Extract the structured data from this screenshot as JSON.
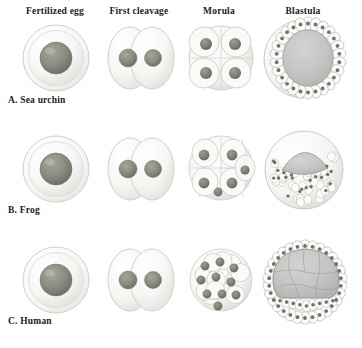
{
  "figure": {
    "background_color": "#ffffff",
    "palette": {
      "nucleus": "#878a7e",
      "nucleus_dark": "#6f7268",
      "membrane": "#f2f2f0",
      "membrane_stroke": "#c9c9c4",
      "cavity": "#c5c7c5",
      "cavity_stroke": "#9a9c99",
      "text": "#1c1c1c"
    }
  },
  "columns": [
    {
      "key": "fertilized_egg",
      "label": "Fertilized egg",
      "center_x": 55
    },
    {
      "key": "first_cleavage",
      "label": "First cleavage",
      "center_x": 139
    },
    {
      "key": "morula",
      "label": "Morula",
      "center_x": 219
    },
    {
      "key": "blastula",
      "label": "Blastula",
      "center_x": 303
    }
  ],
  "rows": [
    {
      "key": "sea_urchin",
      "label": "A. Sea urchin",
      "label_x": 8,
      "label_y": 101,
      "morula_nuclei": 4,
      "blastula_type": "central-cavity-ring"
    },
    {
      "key": "frog",
      "label": "B. Frog",
      "label_x": 8,
      "label_y": 211,
      "morula_nuclei": 6,
      "blastula_type": "offset-crescent-cavity"
    },
    {
      "key": "human",
      "label": "C. Human",
      "label_x": 8,
      "label_y": 322,
      "morula_nuclei": 10,
      "blastula_type": "inner-cell-mass"
    }
  ],
  "stages": [
    {
      "row": "sea_urchin",
      "column": "fertilized_egg",
      "name": "sea-urchin-fertilized-egg",
      "description": "Single round cell with outer membrane and one central nucleus",
      "cell_count": 1,
      "nuclei": 1
    },
    {
      "row": "sea_urchin",
      "column": "first_cleavage",
      "name": "sea-urchin-first-cleavage",
      "description": "Two overlapping oval cells each containing one nucleus",
      "cell_count": 2,
      "nuclei": 2
    },
    {
      "row": "sea_urchin",
      "column": "morula",
      "name": "sea-urchin-morula",
      "description": "Cluster of cells in two-by-two arrangement with four visible nuclei",
      "cell_count": 8,
      "nuclei": 4
    },
    {
      "row": "sea_urchin",
      "column": "blastula",
      "name": "sea-urchin-blastula",
      "description": "Hollow sphere with single layer of cells around a large central blastocoel",
      "cell_count": 32,
      "nuclei": 26
    },
    {
      "row": "frog",
      "column": "fertilized_egg",
      "name": "frog-fertilized-egg",
      "description": "Single round cell with outer membrane and one central nucleus",
      "cell_count": 1,
      "nuclei": 1
    },
    {
      "row": "frog",
      "column": "first_cleavage",
      "name": "frog-first-cleavage",
      "description": "Two overlapping oval cells each containing one nucleus",
      "cell_count": 2,
      "nuclei": 2
    },
    {
      "row": "frog",
      "column": "morula",
      "name": "frog-morula",
      "description": "Rounded cluster of cells with six visible nuclei",
      "cell_count": 12,
      "nuclei": 6
    },
    {
      "row": "frog",
      "column": "blastula",
      "name": "frog-blastula",
      "description": "Sphere of many small cells with an off-center crescent cavity near the top",
      "cell_count": 60,
      "nuclei": 34
    },
    {
      "row": "human",
      "column": "fertilized_egg",
      "name": "human-fertilized-egg",
      "description": "Single round cell with outer membrane and one central nucleus",
      "cell_count": 1,
      "nuclei": 1
    },
    {
      "row": "human",
      "column": "first_cleavage",
      "name": "human-first-cleavage",
      "description": "Two overlapping oval cells each containing one nucleus",
      "cell_count": 2,
      "nuclei": 2
    },
    {
      "row": "human",
      "column": "morula",
      "name": "human-morula",
      "description": "Dense compact mulberry-like cluster with ten visible nuclei",
      "cell_count": 16,
      "nuclei": 10
    },
    {
      "row": "human",
      "column": "blastula",
      "name": "human-blastocyst",
      "description": "Large inner cell mass with visible cell boundaries surrounded by a ring of trophoblast cells",
      "cell_count": 58,
      "nuclei": 30
    }
  ]
}
